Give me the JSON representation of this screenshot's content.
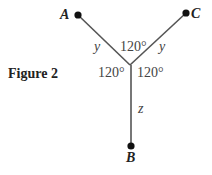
{
  "figure": {
    "caption": "Figure 2",
    "points": [
      {
        "id": "A",
        "label": "A"
      },
      {
        "id": "C",
        "label": "C"
      },
      {
        "id": "B",
        "label": "B"
      }
    ],
    "segments": [
      {
        "from": "A",
        "to": "junction",
        "length_label": "y"
      },
      {
        "from": "C",
        "to": "junction",
        "length_label": "y"
      },
      {
        "from": "B",
        "to": "junction",
        "length_label": "z"
      }
    ],
    "angles": {
      "top": "120°",
      "left": "120°",
      "right": "120°"
    },
    "colors": {
      "line": "#555555",
      "point": "#111111",
      "text": "#333333"
    }
  }
}
